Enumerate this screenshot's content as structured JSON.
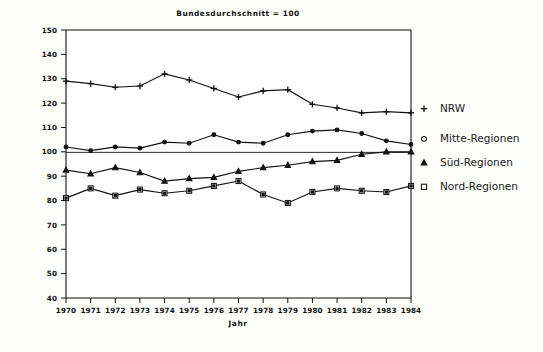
{
  "chart_data": {
    "type": "line",
    "title": "Bundesdurchschnitt = 100",
    "xlabel": "Jahr",
    "ylabel": "",
    "xlim": [
      1970,
      1984
    ],
    "ylim": [
      40,
      150
    ],
    "ytick_step": 10,
    "grid": false,
    "legend_position": "right",
    "reference_line": 100,
    "categories": [
      "1970",
      "1971",
      "1972",
      "1973",
      "1974",
      "1975",
      "1976",
      "1977",
      "1978",
      "1979",
      "1980",
      "1981",
      "1982",
      "1983",
      "1984"
    ],
    "yticks": [
      "40",
      "50",
      "60",
      "70",
      "80",
      "90",
      "100",
      "110",
      "120",
      "130",
      "140",
      "150"
    ],
    "series": [
      {
        "name": "NRW",
        "marker": "plus",
        "values": [
          129,
          128,
          126.5,
          127,
          132,
          129.5,
          126,
          122.5,
          125,
          125.5,
          119.5,
          118,
          116,
          116.5,
          116
        ]
      },
      {
        "name": "Mitte-Regionen",
        "marker": "circle",
        "values": [
          102,
          100.5,
          102,
          101.5,
          104,
          103.5,
          107,
          104,
          103.5,
          107,
          108.5,
          109,
          107.5,
          104.5,
          103
        ]
      },
      {
        "name": "Süd-Regionen",
        "marker": "triangle",
        "values": [
          92.5,
          91,
          93.5,
          91.5,
          88,
          89,
          89.5,
          92,
          93.5,
          94.5,
          96,
          96.5,
          99,
          100,
          100
        ]
      },
      {
        "name": "Nord-Regionen",
        "marker": "square",
        "values": [
          81,
          85,
          82,
          84.5,
          83,
          84,
          86,
          88,
          82.5,
          79,
          83.5,
          85,
          84,
          83.5,
          86
        ]
      }
    ]
  },
  "legend": {
    "entries": [
      {
        "label": "NRW",
        "marker": "plus"
      },
      {
        "label": "Mitte-Regionen",
        "marker": "circle"
      },
      {
        "label": "Süd-Regionen",
        "marker": "triangle"
      },
      {
        "label": "Nord-Regionen",
        "marker": "square"
      }
    ]
  },
  "colors": {
    "ink": "#111111",
    "background": "#fdfdfc"
  }
}
